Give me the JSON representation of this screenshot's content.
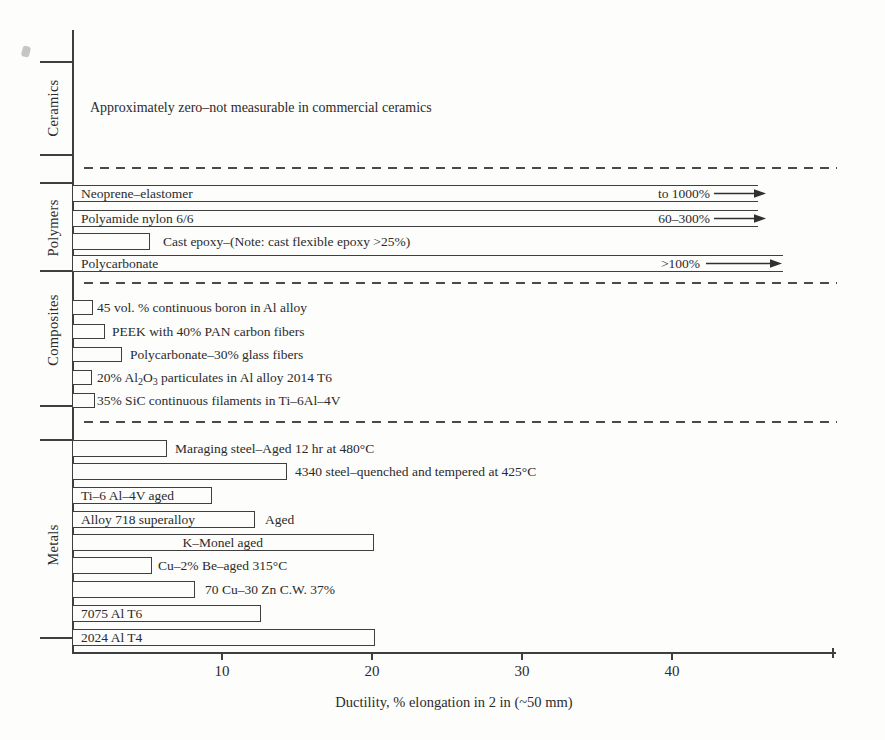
{
  "figure": {
    "categories": [
      "Ceramics",
      "Polymers",
      "Composites",
      "Metals"
    ],
    "ceramics_note": "Approximately zero–not measurable in commercial ceramics",
    "xlabel": "Ductility, % elongation in 2 in (~50 mm)"
  },
  "chart_data": {
    "type": "bar",
    "orientation": "horizontal",
    "xlabel": "Ductility, % elongation in 2 in (~50 mm)",
    "xlim": [
      0,
      51
    ],
    "xticks": [
      10,
      20,
      30,
      40
    ],
    "grid": false,
    "groups": [
      {
        "name": "Ceramics",
        "note": "Approximately zero–not measurable in commercial ceramics",
        "bars": []
      },
      {
        "name": "Polymers",
        "bars": [
          {
            "label": "Neoprene–elastomer",
            "value": 45.7,
            "open_ended": true,
            "range_note": "to 1000%"
          },
          {
            "label": "Polyamide nylon 6/6",
            "value": 45.7,
            "open_ended": true,
            "range_note": "60–300%"
          },
          {
            "label": "Cast epoxy–(Note: cast flexible epoxy >25%)",
            "value": 5.2
          },
          {
            "label": "Polycarbonate",
            "value": 47.4,
            "open_ended": true,
            "range_note": ">100%"
          }
        ]
      },
      {
        "name": "Composites",
        "bars": [
          {
            "label": "45 vol. % continuous boron in Al alloy",
            "value": 1.4
          },
          {
            "label": "PEEK with 40% PAN carbon fibers",
            "value": 2.2
          },
          {
            "label": "Polycarbonate–30% glass fibers",
            "value": 3.3
          },
          {
            "label": "20% Al₂O₃ particulates in Al alloy 2014 T6",
            "value": 1.3,
            "label_parts": [
              "20% Al",
              "2",
              "O",
              "3",
              " particulates in Al alloy 2014 T6"
            ]
          },
          {
            "label": "35% SiC continuous filaments in Ti–6Al–4V",
            "value": 1.5
          }
        ]
      },
      {
        "name": "Metals",
        "bars": [
          {
            "label": "Maraging steel–Aged 12 hr at 480°C",
            "value": 6.3
          },
          {
            "label": "4340 steel–quenched and tempered at 425°C",
            "value": 14.3
          },
          {
            "label": "Ti–6 Al–4V aged",
            "value": 9.3
          },
          {
            "label": "Alloy 718 superalloy",
            "value": 12.2,
            "suffix": "Aged"
          },
          {
            "label": "K–Monel aged",
            "value": 20.1
          },
          {
            "label": "Cu–2% Be–aged 315°C",
            "value": 5.3
          },
          {
            "label": "70 Cu–30 Zn C.W. 37%",
            "value": 8.2
          },
          {
            "label": "7075 Al T6",
            "value": 12.6
          },
          {
            "label": "2024 Al T4",
            "value": 20.2
          }
        ]
      }
    ]
  }
}
